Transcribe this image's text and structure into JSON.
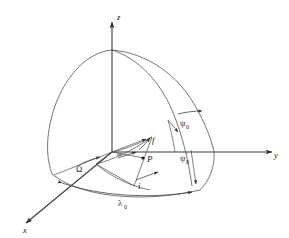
{
  "figure": {
    "name": "orbital-elements-celestial-sphere-diagram",
    "background_color": "#ffffff",
    "line_color": "#3a3a3a",
    "curve_color": "#4a4a4a",
    "text_color": "#1a1a1a"
  },
  "axes": {
    "z": {
      "label": "z",
      "direction": "up"
    },
    "y": {
      "label": "y",
      "direction": "right"
    },
    "x": {
      "label": "x",
      "direction": "lower-left"
    }
  },
  "points": {
    "origin": {
      "label": ""
    },
    "p": {
      "label": "P"
    }
  },
  "angles": {
    "omega_capital": {
      "label": "Ω",
      "description": "longitude of ascending node"
    },
    "omega_small": {
      "label": "ω",
      "description": "argument of periapsis"
    },
    "inclination": {
      "label": "i",
      "description": "inclination"
    },
    "true_anomaly": {
      "label": "f",
      "description": "true anomaly"
    },
    "psi_zero": {
      "label": "ψ",
      "sub": "0",
      "prime": "",
      "description": "psi sub zero"
    },
    "psi_zero_prime": {
      "label": "ψ",
      "sub": "0",
      "prime": "′",
      "description": "psi sub zero prime"
    },
    "lambda_zero": {
      "label": "λ",
      "sub": "0",
      "description": "lambda sub zero"
    }
  }
}
